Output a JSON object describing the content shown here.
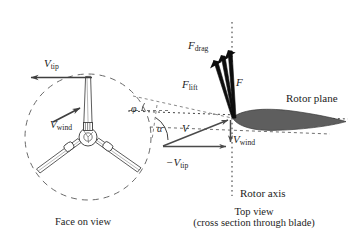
{
  "figure": {
    "background": "#ffffff",
    "ink": "#1d1d1d",
    "airfoil_fill": "#5e5e5e",
    "width": 356,
    "height": 240
  },
  "face_on_view": {
    "caption": "Face on view",
    "rotor_circle": {
      "cx": 88,
      "cy": 137,
      "r": 63,
      "style": "dashed"
    },
    "blade_count": 3,
    "labels": {
      "v_tip": {
        "base": "V",
        "sub": "tip",
        "text": "V tip"
      },
      "v_wind": {
        "base": "V",
        "sub": "wind",
        "text": "V wind"
      }
    },
    "arrows": {
      "v_tip_direction": "left",
      "v_wind_direction": "up-right"
    }
  },
  "top_view": {
    "caption_line1": "Top view",
    "caption_line2": "(cross section through blade)",
    "rotor_axis_label": "Rotor axis",
    "rotor_plane_label": "Rotor plane",
    "forces": {
      "f_drag": {
        "base": "F",
        "sub": "drag",
        "text": "F drag"
      },
      "f_lift": {
        "base": "F",
        "sub": "lift",
        "text": "F lift"
      },
      "f_resultant": {
        "base": "F",
        "sub": "",
        "text": "F"
      }
    },
    "velocities": {
      "v_relative": {
        "base": "V",
        "sub": "",
        "text": "V"
      },
      "v_wind": {
        "base": "V",
        "sub": "wind",
        "text": "V wind"
      },
      "minus_v_tip": {
        "base": "−V",
        "sub": "tip",
        "text": "-V tip"
      }
    },
    "angles": {
      "phi": {
        "symbol": "φ",
        "name": "flow-angle"
      },
      "alpha": {
        "symbol": "α",
        "name": "angle-of-attack"
      }
    }
  }
}
